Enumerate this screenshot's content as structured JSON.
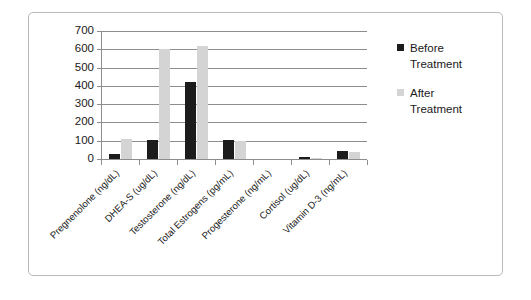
{
  "chart_data": {
    "type": "bar",
    "title": "",
    "xlabel": "",
    "ylabel": "",
    "ylim": [
      0,
      700
    ],
    "ytick_step": 100,
    "yticks": [
      700,
      600,
      500,
      400,
      300,
      200,
      100,
      0
    ],
    "grid": true,
    "legend_position": "right",
    "categories": [
      "Pregnenolone (ng/dL)",
      "DHEA-S (ug/dL)",
      "Testosterone (ng/dL)",
      "Total Estrogens (pg/mL)",
      "Progesterone (ng/mL)",
      "Cortisol (ug/dL)",
      "Vitamin D-3 (ng/mL)"
    ],
    "series": [
      {
        "name": "Before Treatment",
        "color": "#1c1c1c",
        "values": [
          30,
          105,
          420,
          105,
          0,
          12,
          45
        ]
      },
      {
        "name": "After Treatment",
        "color": "#d4d4d4",
        "values": [
          110,
          600,
          620,
          100,
          0,
          8,
          38
        ]
      }
    ]
  },
  "legend": {
    "entries": [
      {
        "label": "Before Treatment",
        "swatch": "black-square-icon"
      },
      {
        "label": "After Treatment",
        "swatch": "gray-square-icon"
      }
    ]
  },
  "colors": {
    "before": "#1c1c1c",
    "after": "#d4d4d4",
    "axis": "#8d8d8d",
    "frame": "#b9b9b9",
    "text": "#1a1a1a",
    "background": "#ffffff"
  }
}
